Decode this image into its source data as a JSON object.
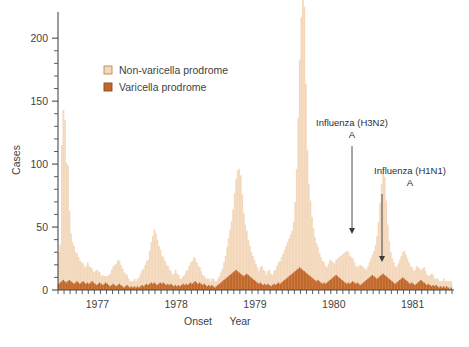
{
  "chart_data": {
    "type": "bar",
    "title": "",
    "subtitle": "",
    "xlabel_parts": [
      "Onset",
      "Year"
    ],
    "xlabel": "Onset   Year",
    "ylabel": "Cases",
    "ylim": [
      0,
      220
    ],
    "y_ticks_major": [
      0,
      50,
      100,
      150,
      200
    ],
    "y_tick_labels": [
      "0",
      "50",
      "100",
      "150",
      "200"
    ],
    "y_tick_minor_step": 10,
    "grid": false,
    "stacked": true,
    "bar_unit": "week",
    "x_tick_labels": [
      "1977",
      "1978",
      "1979",
      "1980",
      "1981"
    ],
    "x_tick_label_index": [
      26,
      78,
      130,
      182,
      234
    ],
    "x_axis_minor_tick_every_n_bars": 4,
    "n_bars": 260,
    "legend": {
      "position": "upper-left-inside",
      "entries": [
        {
          "name": "Non-varicella prodrome",
          "color": "#f3d8bc",
          "swatch_border": "#b98a5e"
        },
        {
          "name": "Varicella prodrome",
          "color": "#c2682b",
          "swatch_border": "#8f4a1d"
        }
      ]
    },
    "series": [
      {
        "name": "Varicella prodrome",
        "color": "#c2682b",
        "values": [
          5,
          6,
          7,
          8,
          7,
          6,
          7,
          8,
          7,
          6,
          5,
          6,
          7,
          6,
          5,
          6,
          7,
          6,
          5,
          6,
          5,
          6,
          7,
          6,
          5,
          4,
          5,
          6,
          5,
          4,
          5,
          6,
          5,
          4,
          3,
          4,
          5,
          4,
          3,
          4,
          5,
          4,
          3,
          2,
          3,
          4,
          3,
          2,
          3,
          2,
          3,
          2,
          3,
          2,
          3,
          4,
          3,
          4,
          5,
          4,
          5,
          6,
          5,
          6,
          5,
          4,
          5,
          6,
          5,
          6,
          5,
          4,
          5,
          4,
          5,
          4,
          3,
          4,
          3,
          4,
          3,
          4,
          5,
          4,
          5,
          4,
          5,
          6,
          5,
          6,
          7,
          6,
          5,
          6,
          5,
          4,
          5,
          4,
          3,
          4,
          3,
          4,
          3,
          2,
          3,
          4,
          5,
          6,
          7,
          8,
          9,
          10,
          11,
          12,
          13,
          14,
          15,
          16,
          15,
          14,
          13,
          12,
          11,
          12,
          13,
          12,
          11,
          10,
          9,
          8,
          7,
          6,
          5,
          6,
          5,
          4,
          5,
          4,
          5,
          4,
          3,
          4,
          5,
          4,
          5,
          6,
          5,
          6,
          7,
          8,
          9,
          10,
          11,
          12,
          13,
          14,
          15,
          16,
          17,
          18,
          17,
          16,
          15,
          14,
          13,
          12,
          11,
          10,
          9,
          8,
          7,
          8,
          7,
          6,
          5,
          6,
          5,
          6,
          7,
          8,
          9,
          10,
          11,
          12,
          11,
          10,
          9,
          8,
          7,
          6,
          5,
          6,
          5,
          6,
          7,
          6,
          5,
          6,
          5,
          4,
          5,
          6,
          7,
          8,
          9,
          10,
          11,
          12,
          11,
          10,
          9,
          10,
          11,
          12,
          13,
          12,
          11,
          10,
          9,
          8,
          7,
          6,
          5,
          6,
          7,
          8,
          9,
          10,
          9,
          8,
          7,
          6,
          5,
          6,
          5,
          4,
          5,
          6,
          7,
          8,
          7,
          6,
          5,
          4,
          5,
          4,
          3,
          4,
          3,
          4,
          3,
          2,
          3,
          2,
          3,
          2,
          3,
          2,
          1,
          2,
          1,
          2
        ]
      },
      {
        "name": "Non-varicella prodrome",
        "color": "#f3d8bc",
        "values": [
          25,
          30,
          108,
          135,
          128,
          95,
          92,
          55,
          38,
          32,
          30,
          24,
          22,
          20,
          18,
          16,
          14,
          12,
          14,
          16,
          14,
          12,
          10,
          8,
          10,
          12,
          10,
          8,
          6,
          8,
          6,
          5,
          6,
          8,
          10,
          12,
          14,
          16,
          18,
          20,
          18,
          16,
          14,
          12,
          10,
          8,
          6,
          5,
          4,
          5,
          6,
          5,
          6,
          8,
          10,
          12,
          14,
          16,
          18,
          20,
          26,
          32,
          38,
          42,
          40,
          36,
          30,
          26,
          22,
          20,
          18,
          16,
          14,
          12,
          10,
          8,
          10,
          12,
          10,
          8,
          6,
          5,
          6,
          8,
          10,
          12,
          14,
          16,
          18,
          20,
          18,
          16,
          14,
          12,
          10,
          8,
          6,
          5,
          6,
          5,
          4,
          5,
          6,
          5,
          4,
          5,
          6,
          8,
          10,
          14,
          18,
          24,
          30,
          36,
          42,
          50,
          62,
          72,
          80,
          82,
          78,
          64,
          50,
          40,
          34,
          28,
          24,
          20,
          18,
          16,
          14,
          12,
          10,
          12,
          14,
          12,
          10,
          8,
          10,
          12,
          10,
          8,
          10,
          12,
          14,
          16,
          18,
          20,
          22,
          24,
          26,
          28,
          30,
          32,
          34,
          40,
          55,
          80,
          120,
          165,
          200,
          215,
          210,
          150,
          98,
          72,
          60,
          48,
          40,
          34,
          30,
          26,
          22,
          20,
          18,
          16,
          14,
          12,
          14,
          16,
          14,
          12,
          10,
          12,
          14,
          16,
          18,
          20,
          22,
          24,
          26,
          24,
          22,
          20,
          18,
          16,
          14,
          12,
          14,
          16,
          14,
          12,
          10,
          8,
          10,
          12,
          14,
          16,
          20,
          26,
          34,
          44,
          58,
          72,
          80,
          78,
          60,
          42,
          30,
          22,
          18,
          16,
          14,
          12,
          14,
          16,
          18,
          20,
          22,
          20,
          18,
          16,
          14,
          12,
          10,
          12,
          14,
          12,
          10,
          8,
          10,
          12,
          10,
          8,
          6,
          8,
          10,
          8,
          6,
          5,
          6,
          5,
          4,
          5,
          6,
          5,
          4,
          5,
          6,
          5,
          4,
          3,
          4
        ]
      }
    ],
    "annotations": [
      {
        "id": "h3n2",
        "label_line1": "Influenza (H3N2)",
        "label_line2": "A",
        "arrow_from_x": 352,
        "arrow_from_y": 146,
        "arrow_to_x": 352,
        "arrow_to_y": 234,
        "text_x": 352,
        "text_y": 126
      },
      {
        "id": "h1n1",
        "label_line1": "Influenza (H1N1)",
        "label_line2": "A",
        "arrow_from_x": 382,
        "arrow_from_y": 194,
        "arrow_to_x": 382,
        "arrow_to_y": 262,
        "text_x": 410,
        "text_y": 174
      }
    ]
  },
  "colors": {
    "non_varicella": "#f3d8bc",
    "varicella": "#c2682b",
    "axis": "#4a4a4a",
    "text": "#3f3f3f",
    "background": "#ffffff"
  }
}
